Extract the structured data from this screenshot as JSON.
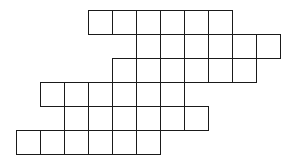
{
  "diagram": {
    "type": "grid-shape",
    "cell_size": 24,
    "origin": {
      "x": 16,
      "y": 10
    },
    "line_color": "#1a1a1a",
    "fill_color": "#ffffff",
    "rows": [
      {
        "row": 0,
        "start_col": 3,
        "count": 6
      },
      {
        "row": 1,
        "start_col": 5,
        "count": 6
      },
      {
        "row": 2,
        "start_col": 4,
        "count": 6
      },
      {
        "row": 3,
        "start_col": 1,
        "count": 6
      },
      {
        "row": 4,
        "start_col": 2,
        "count": 6
      },
      {
        "row": 5,
        "start_col": 0,
        "count": 6
      }
    ],
    "total_cells": 36
  }
}
